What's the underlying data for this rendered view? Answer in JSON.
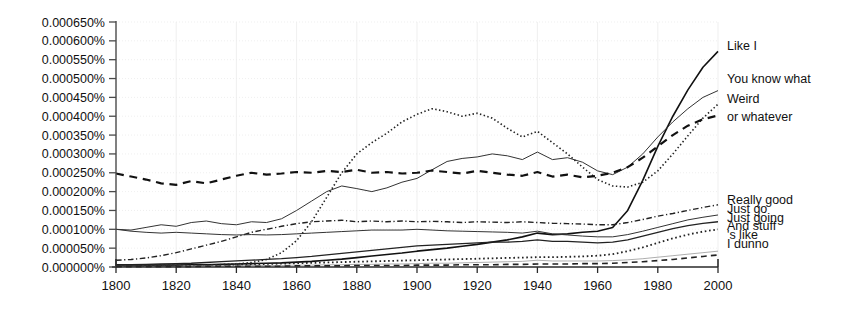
{
  "chart_data": {
    "type": "line",
    "title": "",
    "xlabel": "",
    "ylabel": "",
    "xlim": [
      1800,
      2000
    ],
    "ylim": [
      0.0,
      0.00065
    ],
    "grid": true,
    "legend_position": "right-inline",
    "xticks": [
      1800,
      1820,
      1840,
      1860,
      1880,
      1900,
      1920,
      1940,
      1960,
      1980,
      2000
    ],
    "xticklabels": [
      "1800",
      "1820",
      "1840",
      "1860",
      "1880",
      "1900",
      "1920",
      "1940",
      "1960",
      "1980",
      "2000"
    ],
    "yticks": [
      0.0,
      5e-05,
      0.0001,
      0.00015,
      0.0002,
      0.00025,
      0.0003,
      0.00035,
      0.0004,
      0.00045,
      0.0005,
      0.00055,
      0.0006,
      0.00065
    ],
    "yticklabels": [
      "0.000000%",
      "0.000050%",
      "0.000100%",
      "0.000150%",
      "0.000200%",
      "0.000250%",
      "0.000300%",
      "0.000350%",
      "0.000400%",
      "0.000450%",
      "0.000500%",
      "0.000550%",
      "0.000600%",
      "0.000650%"
    ],
    "x": [
      1800,
      1805,
      1810,
      1815,
      1820,
      1825,
      1830,
      1835,
      1840,
      1845,
      1850,
      1855,
      1860,
      1865,
      1870,
      1875,
      1880,
      1885,
      1890,
      1895,
      1900,
      1905,
      1910,
      1915,
      1920,
      1925,
      1930,
      1935,
      1940,
      1945,
      1950,
      1955,
      1960,
      1965,
      1970,
      1975,
      1980,
      1985,
      1990,
      1995,
      2000
    ],
    "series": [
      {
        "name": "Like I",
        "label": "Like I",
        "style": "solid",
        "width": 1.6,
        "color": "#111111",
        "label_y": 0.000588,
        "values": [
          4e-06,
          4e-06,
          5e-06,
          5e-06,
          5e-06,
          6e-06,
          6e-06,
          7e-06,
          8e-06,
          9e-06,
          1e-05,
          1.1e-05,
          1.3e-05,
          1.5e-05,
          1.8e-05,
          2.1e-05,
          2.5e-05,
          2.9e-05,
          3.3e-05,
          3.7e-05,
          4.2e-05,
          4.6e-05,
          5e-05,
          5.5e-05,
          6e-05,
          6.6e-05,
          7.2e-05,
          8e-05,
          9e-05,
          8.6e-05,
          8.8e-05,
          9.2e-05,
          9.5e-05,
          0.000105,
          0.00015,
          0.00023,
          0.00032,
          0.0004,
          0.00047,
          0.00053,
          0.000572
        ]
      },
      {
        "name": "You know what",
        "label": "You know what",
        "style": "solid",
        "width": 1.0,
        "color": "#333333",
        "label_y": 0.0005,
        "values": [
          0.0001,
          9.8e-05,
          0.000105,
          0.000112,
          0.000108,
          0.000118,
          0.000122,
          0.000115,
          0.000112,
          0.00012,
          0.000118,
          0.000128,
          0.00015,
          0.000175,
          0.0002,
          0.000215,
          0.000208,
          0.0002,
          0.00021,
          0.000225,
          0.000235,
          0.000258,
          0.00028,
          0.000288,
          0.000292,
          0.0003,
          0.000295,
          0.000285,
          0.000305,
          0.000285,
          0.00029,
          0.000278,
          0.000255,
          0.000245,
          0.000265,
          0.0003,
          0.000345,
          0.000385,
          0.00042,
          0.00045,
          0.000468
        ]
      },
      {
        "name": "Weird",
        "label": "Weird",
        "style": "dotted",
        "width": 1.6,
        "color": "#222222",
        "label_y": 0.000448,
        "values": [
          2e-06,
          2e-06,
          3e-06,
          3e-06,
          4e-06,
          4e-06,
          5e-06,
          6e-06,
          8e-06,
          1.2e-05,
          2e-05,
          3.8e-05,
          7e-05,
          0.00012,
          0.000185,
          0.00025,
          0.0003,
          0.00033,
          0.000355,
          0.000385,
          0.000405,
          0.00042,
          0.000412,
          0.0004,
          0.000408,
          0.000395,
          0.000368,
          0.000345,
          0.00036,
          0.00033,
          0.0003,
          0.000265,
          0.000232,
          0.000215,
          0.000212,
          0.000225,
          0.000255,
          0.0003,
          0.000348,
          0.000395,
          0.000432
        ]
      },
      {
        "name": "or whatever",
        "label": "or whatever",
        "style": "dashed",
        "width": 2.2,
        "color": "#111111",
        "label_y": 0.000398,
        "values": [
          0.000248,
          0.00024,
          0.000232,
          0.000222,
          0.000218,
          0.000228,
          0.000222,
          0.000232,
          0.000242,
          0.00025,
          0.000245,
          0.000248,
          0.000252,
          0.00025,
          0.000255,
          0.000252,
          0.000258,
          0.00025,
          0.000252,
          0.000248,
          0.00025,
          0.000256,
          0.000252,
          0.000248,
          0.000255,
          0.00025,
          0.000245,
          0.000242,
          0.000252,
          0.00024,
          0.000245,
          0.000238,
          0.000242,
          0.00025,
          0.000265,
          0.00029,
          0.00032,
          0.00035,
          0.000375,
          0.000392,
          0.000402
        ]
      },
      {
        "name": "Really good",
        "label": "Really good",
        "style": "dashdot",
        "width": 1.4,
        "color": "#222222",
        "label_y": 0.000178,
        "values": [
          1.8e-05,
          2e-05,
          2.4e-05,
          3e-05,
          3.8e-05,
          4.8e-05,
          5.8e-05,
          6.8e-05,
          8e-05,
          9.2e-05,
          0.0001,
          0.000108,
          0.000115,
          0.00012,
          0.000122,
          0.000124,
          0.00012,
          0.000122,
          0.00012,
          0.000122,
          0.00012,
          0.000121,
          0.00012,
          0.000118,
          0.00012,
          0.000119,
          0.000118,
          0.00012,
          0.000118,
          0.000116,
          0.000115,
          0.000114,
          0.000112,
          0.000112,
          0.000118,
          0.000126,
          0.000135,
          0.000142,
          0.00015,
          0.000158,
          0.000165
        ]
      },
      {
        "name": "Just go",
        "label": "Just go",
        "style": "solid",
        "width": 1.0,
        "color": "#333333",
        "label_y": 0.000155,
        "values": [
          0.0001,
          9.5e-05,
          9.2e-05,
          9e-05,
          9.2e-05,
          9e-05,
          8.8e-05,
          8.6e-05,
          8.5e-05,
          8.6e-05,
          8.5e-05,
          8.6e-05,
          8.8e-05,
          9e-05,
          9.2e-05,
          9.4e-05,
          9.6e-05,
          9.8e-05,
          9.8e-05,
          9.8e-05,
          0.0001,
          9.8e-05,
          9.6e-05,
          9.5e-05,
          9.4e-05,
          9.3e-05,
          9.2e-05,
          9e-05,
          9.5e-05,
          8.8e-05,
          8.5e-05,
          8.2e-05,
          8e-05,
          8e-05,
          8.6e-05,
          9.5e-05,
          0.000105,
          0.000115,
          0.000125,
          0.000132,
          0.000138
        ]
      },
      {
        "name": "Just going",
        "label": "Just going",
        "style": "solid",
        "width": 1.3,
        "color": "#222222",
        "label_y": 0.000132,
        "values": [
          6e-06,
          6e-06,
          7e-06,
          8e-06,
          9e-06,
          1e-05,
          1.2e-05,
          1.4e-05,
          1.6e-05,
          1.8e-05,
          2e-05,
          2.2e-05,
          2.5e-05,
          2.8e-05,
          3.2e-05,
          3.6e-05,
          4e-05,
          4.4e-05,
          4.8e-05,
          5.2e-05,
          5.6e-05,
          5.8e-05,
          6e-05,
          6.2e-05,
          6.4e-05,
          6.6e-05,
          6.6e-05,
          6.8e-05,
          7.2e-05,
          6.8e-05,
          6.8e-05,
          6.6e-05,
          6.4e-05,
          6.6e-05,
          7.2e-05,
          8.2e-05,
          9.2e-05,
          0.000102,
          0.00011,
          0.000116,
          0.00012
        ]
      },
      {
        "name": "And stuff",
        "label": "And stuff",
        "style": "dotted",
        "width": 1.8,
        "color": "#222222",
        "label_y": 0.00011,
        "values": [
          3e-06,
          3e-06,
          3e-06,
          4e-06,
          4e-06,
          5e-06,
          5e-06,
          6e-06,
          6e-06,
          7e-06,
          8e-06,
          9e-06,
          1e-05,
          1.1e-05,
          1.2e-05,
          1.3e-05,
          1.4e-05,
          1.5e-05,
          1.6e-05,
          1.7e-05,
          1.8e-05,
          1.9e-05,
          2e-05,
          2.1e-05,
          2.2e-05,
          2.3e-05,
          2.4e-05,
          2.5e-05,
          2.6e-05,
          2.6e-05,
          2.7e-05,
          2.8e-05,
          3e-05,
          3.4e-05,
          4.2e-05,
          5.2e-05,
          6.4e-05,
          7.6e-05,
          8.6e-05,
          9.4e-05,
          0.0001
        ]
      },
      {
        "name": "'s like",
        "label": "'s like",
        "style": "solid",
        "width": 0.8,
        "color": "#999999",
        "label_y": 8.6e-05,
        "values": [
          2e-06,
          2e-06,
          2e-06,
          2e-06,
          2e-06,
          3e-06,
          3e-06,
          3e-06,
          3e-06,
          4e-06,
          4e-06,
          4e-06,
          5e-06,
          5e-06,
          6e-06,
          6e-06,
          7e-06,
          7e-06,
          8e-06,
          8e-06,
          9e-06,
          1e-05,
          1e-05,
          1.1e-05,
          1.2e-05,
          1.3e-05,
          1.4e-05,
          1.5e-05,
          1.8e-05,
          1.6e-05,
          1.6e-05,
          1.6e-05,
          1.6e-05,
          1.7e-05,
          1.9e-05,
          2.2e-05,
          2.6e-05,
          3e-05,
          3.4e-05,
          3.8e-05,
          4.2e-05
        ]
      },
      {
        "name": "I dunno",
        "label": "I dunno",
        "style": "dashed",
        "width": 1.6,
        "color": "#222222",
        "label_y": 6.2e-05,
        "values": [
          1e-06,
          1e-06,
          1e-06,
          1e-06,
          1e-06,
          1e-06,
          2e-06,
          2e-06,
          2e-06,
          2e-06,
          2e-06,
          2e-06,
          3e-06,
          3e-06,
          3e-06,
          3e-06,
          4e-06,
          4e-06,
          4e-06,
          4e-06,
          5e-06,
          5e-06,
          5e-06,
          6e-06,
          6e-06,
          6e-06,
          7e-06,
          7e-06,
          8e-06,
          8e-06,
          8e-06,
          9e-06,
          9e-06,
          1e-05,
          1.2e-05,
          1.4e-05,
          1.7e-05,
          2e-05,
          2.4e-05,
          2.8e-05,
          3.2e-05
        ]
      }
    ]
  }
}
